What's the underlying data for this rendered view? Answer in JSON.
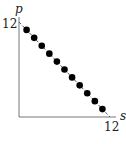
{
  "chart_data": {
    "type": "scatter",
    "title": "",
    "xlabel": "s",
    "ylabel": "p",
    "xlim": [
      0,
      12
    ],
    "ylim": [
      0,
      12
    ],
    "x_ticks": [
      "12"
    ],
    "y_ticks": [
      "12"
    ],
    "grid": false,
    "legend": null,
    "series": [
      {
        "name": "points",
        "style": "filled-circle",
        "color": "#000000",
        "x": [
          1,
          2,
          3,
          4,
          5,
          6,
          7,
          8,
          9,
          10,
          11
        ],
        "y": [
          11,
          10,
          9,
          8,
          7,
          6,
          5,
          4,
          3,
          2,
          1
        ]
      },
      {
        "name": "line p = 12 - s",
        "style": "dashed-line",
        "color": "#555555",
        "x": [
          0,
          12
        ],
        "y": [
          12,
          0
        ]
      }
    ]
  },
  "labels": {
    "y_axis": "p",
    "x_axis": "s",
    "y_tick": "12",
    "x_tick": "12"
  }
}
